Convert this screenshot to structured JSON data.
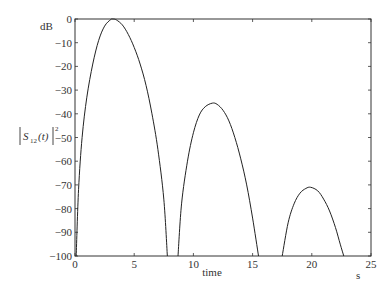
{
  "chart_data": {
    "type": "line",
    "title": "",
    "xlabel": "time",
    "xunit": "s",
    "ylabel": "|S12(t)|^2",
    "yunit": "dB",
    "xlim": [
      0,
      25
    ],
    "ylim": [
      -100,
      0
    ],
    "xticks": [
      0,
      5,
      10,
      15,
      20,
      25
    ],
    "yticks": [
      0,
      -10,
      -20,
      -30,
      -40,
      -50,
      -60,
      -70,
      -80,
      -90,
      -100
    ],
    "grid": false,
    "legend": null,
    "series": [
      {
        "name": "lobe 1",
        "x": [
          0.1,
          0.3,
          0.6,
          1.0,
          1.5,
          2.0,
          2.5,
          3.0,
          3.2,
          3.5,
          4.0,
          4.5,
          5.0,
          5.5,
          6.0,
          6.5,
          7.0,
          7.5,
          7.8
        ],
        "y": [
          -100,
          -72,
          -50,
          -33,
          -19,
          -9,
          -3,
          -0.3,
          0,
          -0.4,
          -2.5,
          -6.5,
          -12,
          -19,
          -28,
          -40,
          -55,
          -76,
          -100
        ]
      },
      {
        "name": "lobe 2",
        "x": [
          8.7,
          9.0,
          9.5,
          10.0,
          10.5,
          11.0,
          11.6,
          12.0,
          12.5,
          13.0,
          13.5,
          14.0,
          14.5,
          15.0,
          15.5
        ],
        "y": [
          -100,
          -78,
          -60,
          -48,
          -40.5,
          -37,
          -35.5,
          -36,
          -38.5,
          -43,
          -50,
          -59,
          -70,
          -84,
          -100
        ]
      },
      {
        "name": "lobe 3",
        "x": [
          17.5,
          18.0,
          18.5,
          19.0,
          19.5,
          19.9,
          20.5,
          21.0,
          21.5,
          22.0,
          22.4,
          22.7
        ],
        "y": [
          -100,
          -86,
          -78,
          -73.5,
          -71.5,
          -71,
          -72.5,
          -76,
          -81,
          -88,
          -95,
          -100
        ]
      }
    ]
  },
  "labels": {
    "yunit": "dB",
    "xlabel": "time",
    "xunit": "s",
    "ylabel_base": "S",
    "ylabel_sub": "12",
    "ylabel_arg": "(t)",
    "ylabel_sup": "2"
  }
}
